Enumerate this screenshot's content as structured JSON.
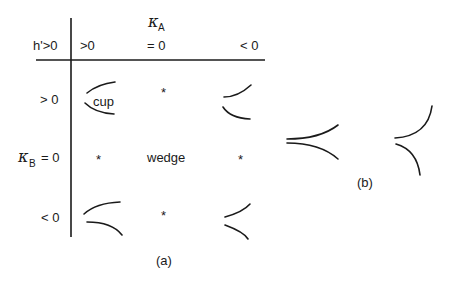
{
  "panel_a": {
    "caption": "(a)",
    "corner_label": "h'>0",
    "column_header": {
      "symbol": "κ",
      "subscript": "A"
    },
    "row_header": {
      "symbol": "κ",
      "subscript": "B",
      "suffix": "= 0"
    },
    "columns": [
      ">0",
      "= 0",
      "< 0"
    ],
    "rows": [
      "> 0",
      "< 0"
    ],
    "cells": {
      "r0c0": "cup",
      "r0c1": "*",
      "r1c0": "*",
      "r1c1": "wedge",
      "r1c2": "*",
      "r2c1": "*"
    }
  },
  "panel_b": {
    "caption": "(b)"
  }
}
